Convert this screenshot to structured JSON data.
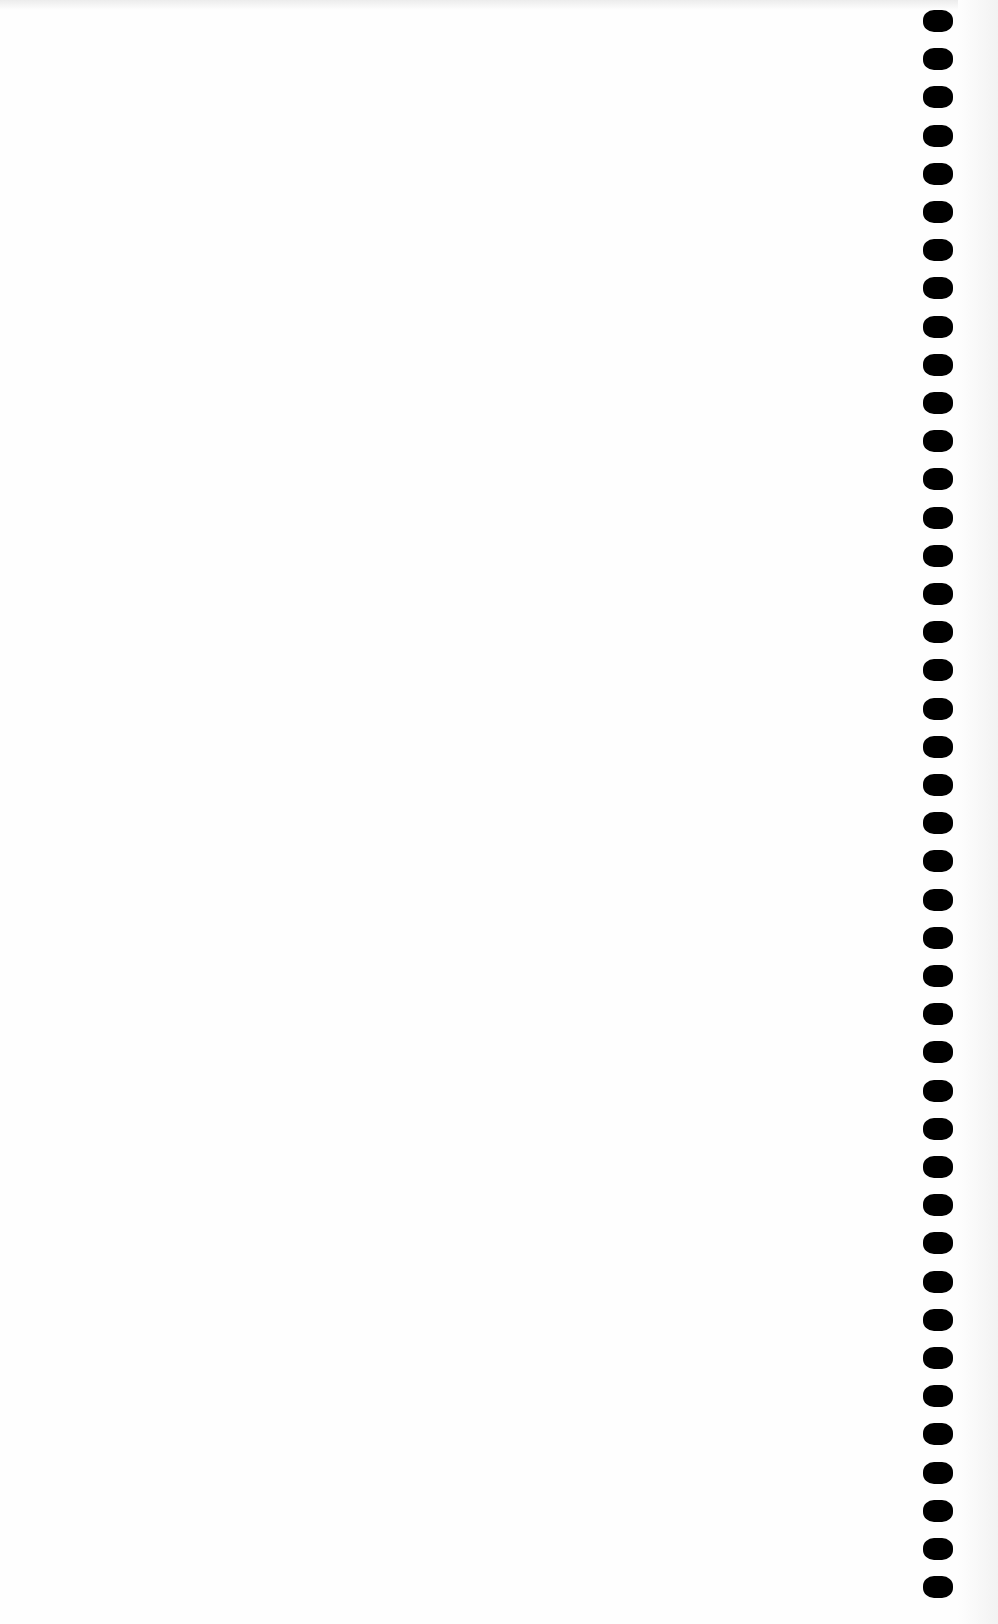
{
  "page": {
    "background": "#fefefe"
  },
  "binder_holes": {
    "count": 42,
    "center_x": 938,
    "first_center_y": 21,
    "pitch_y": 38.2,
    "width": 30,
    "height": 22,
    "color": "#000000"
  }
}
